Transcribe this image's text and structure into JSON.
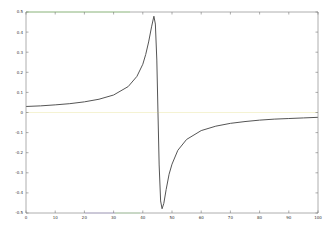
{
  "chart_data": {
    "type": "line",
    "title": "",
    "xlabel": "",
    "ylabel": "",
    "xlim": [
      0,
      100
    ],
    "ylim": [
      -0.5,
      0.5
    ],
    "grid": false,
    "legend": null,
    "x_ticks": [
      0,
      10,
      20,
      30,
      40,
      50,
      60,
      70,
      80,
      90,
      100
    ],
    "x_tick_labels": [
      "0",
      "10",
      "20",
      "30",
      "40",
      "50",
      "60",
      "70",
      "80",
      "90",
      "100"
    ],
    "y_ticks": [
      0.5,
      0.4,
      0.3,
      0.2,
      0.1,
      0,
      -0.1,
      -0.2,
      -0.3,
      -0.4,
      -0.5
    ],
    "y_tick_labels": [
      "0.5",
      "0.4",
      "0.3",
      "0.2",
      "0.1",
      "0",
      "-0.1",
      "-0.2",
      "-0.3",
      "-0.4",
      "-0.5"
    ],
    "series": [
      {
        "name": "signal",
        "color": "#555555",
        "x": [
          0,
          5,
          10,
          15,
          20,
          25,
          30,
          35,
          38,
          40,
          41,
          42,
          43,
          43.8,
          44.3,
          44.8,
          45.2,
          45.6,
          46.1,
          46.6,
          47.2,
          48,
          49,
          50,
          52,
          55,
          60,
          65,
          70,
          75,
          80,
          85,
          90,
          95,
          100
        ],
        "y": [
          0.03,
          0.033,
          0.038,
          0.044,
          0.053,
          0.066,
          0.087,
          0.129,
          0.18,
          0.24,
          0.289,
          0.351,
          0.426,
          0.479,
          0.44,
          0.261,
          0.0,
          -0.261,
          -0.44,
          -0.479,
          -0.452,
          -0.383,
          -0.307,
          -0.257,
          -0.188,
          -0.134,
          -0.09,
          -0.068,
          -0.054,
          -0.045,
          -0.038,
          -0.033,
          -0.03,
          -0.027,
          -0.024
        ]
      }
    ]
  },
  "colors": {
    "axis": "#666666",
    "zero_line": "#f3f0c8",
    "top_edge_accent": "#7fe05a"
  }
}
